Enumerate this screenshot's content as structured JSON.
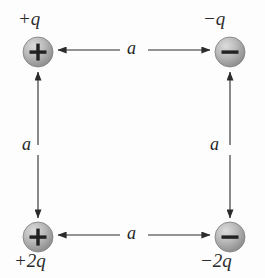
{
  "figure": {
    "background_color": "#fdfdfd",
    "line_color": "#2b2b2b",
    "sphere_fill_light": "#d8d8d8",
    "sphere_fill_dark": "#8e8e8e",
    "sphere_radius_px": 15
  },
  "charges": [
    {
      "id": "top-left",
      "label": "+q",
      "sign_glyph": "+",
      "polarity": "positive",
      "center": {
        "x": 38,
        "y": 52
      }
    },
    {
      "id": "top-right",
      "label": "−q",
      "sign_glyph": "−",
      "polarity": "negative",
      "center": {
        "x": 230,
        "y": 52
      }
    },
    {
      "id": "bottom-left",
      "label": "+2q",
      "sign_glyph": "+",
      "polarity": "positive",
      "center": {
        "x": 38,
        "y": 237
      }
    },
    {
      "id": "bottom-right",
      "label": "−2q",
      "sign_glyph": "−",
      "polarity": "negative",
      "center": {
        "x": 230,
        "y": 237
      }
    }
  ],
  "dimensions": [
    {
      "id": "top",
      "label": "a",
      "orientation": "horizontal",
      "between": [
        "top-left",
        "top-right"
      ]
    },
    {
      "id": "bottom",
      "label": "a",
      "orientation": "horizontal",
      "between": [
        "bottom-left",
        "bottom-right"
      ]
    },
    {
      "id": "left",
      "label": "a",
      "orientation": "vertical",
      "between": [
        "bottom-left",
        "top-left"
      ]
    },
    {
      "id": "right",
      "label": "a",
      "orientation": "vertical",
      "between": [
        "bottom-right",
        "top-right"
      ]
    }
  ]
}
